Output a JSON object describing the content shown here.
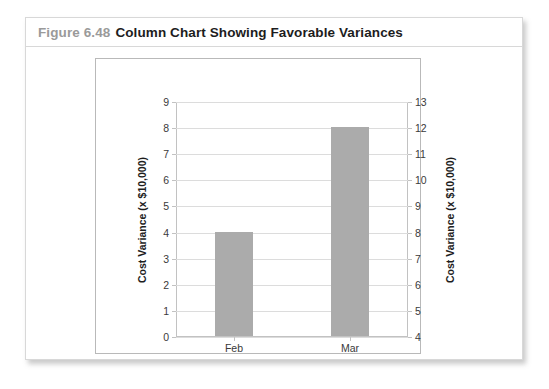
{
  "figure": {
    "number": "Figure 6.48",
    "title": "Column Chart Showing Favorable Variances"
  },
  "chart_data": {
    "type": "bar",
    "title": "Column Chart Showing Favorable Variances",
    "categories": [
      "Feb",
      "Mar"
    ],
    "values": [
      4,
      8
    ],
    "series": [
      {
        "name": "Cost Variance",
        "values": [
          4,
          8
        ]
      }
    ],
    "xlabel": "",
    "ylabel": "Cost Variance (x $10,000)",
    "ylim": [
      0,
      9
    ],
    "yticks": [
      0,
      1,
      2,
      3,
      4,
      5,
      6,
      7,
      8,
      9
    ],
    "secondary_axis": {
      "label": "Cost Variance (x $10,000)",
      "ylim": [
        4,
        13
      ],
      "yticks": [
        4,
        5,
        6,
        7,
        8,
        9,
        10,
        11,
        12,
        13
      ]
    },
    "grid": true,
    "legend": "none",
    "bar_color": "#ababab",
    "gridline_color": "#dcdcdc",
    "axis_color": "#c2c2c2"
  }
}
